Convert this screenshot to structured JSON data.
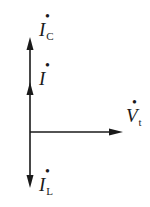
{
  "diagram": {
    "type": "phasor",
    "colors": {
      "stroke": "#1a1a1a",
      "background": "#ffffff"
    },
    "phasors": [
      {
        "id": "Ic",
        "symbol": "I",
        "subscript": "C",
        "dot": "•",
        "direction": "up",
        "magnitude": "long"
      },
      {
        "id": "I",
        "symbol": "I",
        "subscript": "",
        "dot": "•",
        "direction": "up",
        "magnitude": "medium"
      },
      {
        "id": "Vt",
        "symbol": "V",
        "subscript": "t",
        "dot": "•",
        "direction": "right",
        "magnitude": "reference"
      },
      {
        "id": "IL",
        "symbol": "I",
        "subscript": "L",
        "dot": "•",
        "direction": "down",
        "magnitude": "short"
      }
    ],
    "labels": {
      "ic_symbol": "I",
      "ic_sub": "C",
      "i_symbol": "I",
      "vt_symbol": "V",
      "vt_sub": "t",
      "il_symbol": "I",
      "il_sub": "L",
      "dot": "•"
    }
  }
}
